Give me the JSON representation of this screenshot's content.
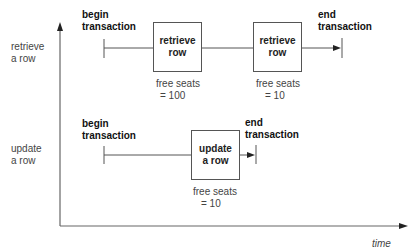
{
  "axes": {
    "x_label": "time",
    "y_labels": [
      {
        "line1": "retrieve",
        "line2": "a row"
      },
      {
        "line1": "update",
        "line2": "a row"
      }
    ]
  },
  "rows": [
    {
      "name": "retrieve-a-row",
      "begin": {
        "line1": "begin",
        "line2": "transaction"
      },
      "end": {
        "line1": "end",
        "line2": "transaction"
      },
      "boxes": [
        {
          "line1": "retrieve",
          "line2": "row",
          "seats_line1": "free seats",
          "seats_line2": "= 100"
        },
        {
          "line1": "retrieve",
          "line2": "row",
          "seats_line1": "free seats",
          "seats_line2": "= 10"
        }
      ]
    },
    {
      "name": "update-a-row",
      "begin": {
        "line1": "begin",
        "line2": "transaction"
      },
      "end": {
        "line1": "end",
        "line2": "transaction"
      },
      "boxes": [
        {
          "line1": "update",
          "line2": "a row",
          "seats_line1": "free seats",
          "seats_line2": "= 10"
        }
      ]
    }
  ],
  "colors": {
    "line": "#555555",
    "text": "#222222"
  }
}
